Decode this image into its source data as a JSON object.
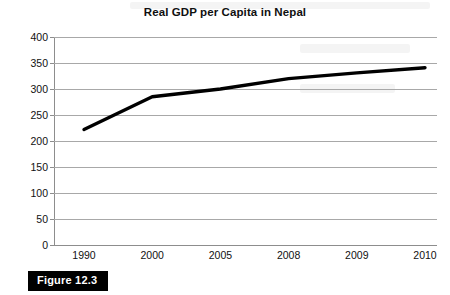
{
  "chart_data": {
    "type": "line",
    "title": "Real GDP per Capita in Nepal",
    "xlabel": "",
    "ylabel": "",
    "categories": [
      "1990",
      "2000",
      "2005",
      "2008",
      "2009",
      "2010"
    ],
    "values": [
      222,
      285,
      300,
      320,
      331,
      341
    ],
    "series": [
      {
        "name": "Real GDP per Capita",
        "values": [
          222,
          285,
          300,
          320,
          331,
          341
        ]
      }
    ],
    "ylim": [
      0,
      400
    ],
    "ytick_step": 50,
    "yticks": [
      "400",
      "350",
      "300",
      "250",
      "200",
      "150",
      "100",
      "50",
      "0"
    ],
    "xticks": [
      "1990",
      "2000",
      "2005",
      "2008",
      "2009",
      "2010"
    ],
    "grid": true,
    "legend": false,
    "legend_position": "none",
    "line_color": "#000000",
    "grid_color": "#a8a8a8",
    "axis_color": "#8d8d8d",
    "markers": false
  },
  "figure": {
    "caption": "Figure 12.3",
    "caption_bg": "#000000",
    "caption_color": "#ffffff"
  }
}
